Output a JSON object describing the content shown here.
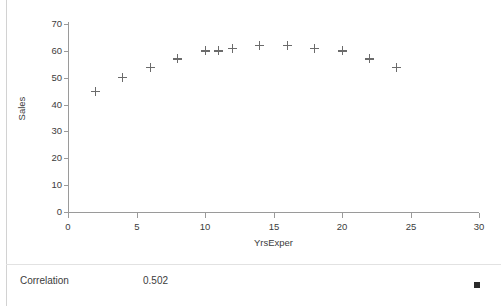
{
  "chart_data": {
    "type": "scatter",
    "title": "",
    "xlabel": "YrsExper",
    "ylabel": "Sales",
    "xlim": [
      0,
      30
    ],
    "ylim": [
      0,
      70
    ],
    "xticks": [
      0,
      5,
      10,
      15,
      20,
      25,
      30
    ],
    "yticks": [
      0,
      10,
      20,
      30,
      40,
      50,
      60,
      70
    ],
    "grid": false,
    "legend": "none",
    "marker": "plus",
    "marker_color": "#6b6b6b",
    "series": [
      {
        "name": "Sales vs YrsExper",
        "x": [
          2,
          4,
          6,
          8,
          10,
          11,
          12,
          14,
          16,
          18,
          20,
          22,
          24
        ],
        "y": [
          45,
          50,
          54,
          57,
          60,
          60,
          61,
          62,
          62,
          61,
          60,
          57,
          54
        ]
      }
    ],
    "points": [
      {
        "x": 2,
        "y": 45
      },
      {
        "x": 4,
        "y": 50
      },
      {
        "x": 6,
        "y": 54
      },
      {
        "x": 8,
        "y": 57
      },
      {
        "x": 10,
        "y": 60
      },
      {
        "x": 11,
        "y": 60
      },
      {
        "x": 12,
        "y": 61
      },
      {
        "x": 14,
        "y": 62
      },
      {
        "x": 16,
        "y": 62
      },
      {
        "x": 18,
        "y": 61
      },
      {
        "x": 20,
        "y": 60
      },
      {
        "x": 22,
        "y": 57
      },
      {
        "x": 24,
        "y": 54
      }
    ]
  },
  "axes": {
    "y": {
      "title": "Sales",
      "tick_labels": [
        "70",
        "60",
        "50",
        "40",
        "30",
        "20",
        "10",
        "0"
      ]
    },
    "x": {
      "title": "YrsExper",
      "tick_labels": [
        "0",
        "5",
        "10",
        "15",
        "20",
        "25",
        "30"
      ]
    }
  },
  "stats": {
    "label": "Correlation",
    "value": "0.502"
  },
  "colors": {
    "axis": "#9a9a9a",
    "marker": "#6b6b6b",
    "text": "#3c3c3c",
    "border": "#d2d2d2",
    "handle": "#2b2b2b"
  }
}
